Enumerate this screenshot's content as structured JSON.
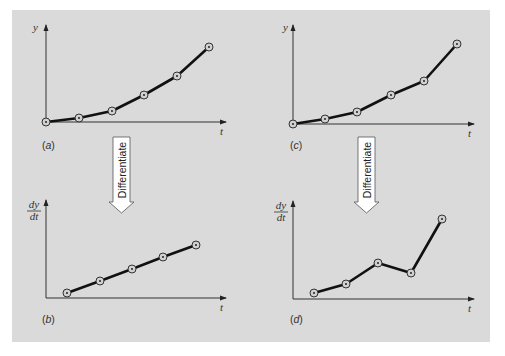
{
  "figure": {
    "background": "#dadada",
    "line_color": "#111111",
    "arrow_text": "Differentiate"
  },
  "chart_data": [
    {
      "type": "line",
      "panel": "a",
      "label_prefix": "(",
      "label_letter": "a",
      "label_suffix": ")",
      "ylabel": "y",
      "xlabel": "t",
      "x": [
        0,
        1,
        2,
        3,
        4,
        5
      ],
      "values": [
        0,
        0.1,
        0.25,
        0.6,
        1.0,
        1.6
      ],
      "px": [
        [
          46,
          122
        ],
        [
          79,
          118
        ],
        [
          112,
          111
        ],
        [
          144,
          95
        ],
        [
          177,
          76
        ],
        [
          209,
          47
        ]
      ]
    },
    {
      "type": "line",
      "panel": "b",
      "label_prefix": "(",
      "label_letter": "b",
      "label_suffix": ")",
      "ylabel_num": "dy",
      "ylabel_den": "dt",
      "xlabel": "t",
      "x": [
        0.5,
        1.5,
        2.5,
        3.5,
        4.5
      ],
      "values": [
        0.1,
        0.25,
        0.4,
        0.55,
        0.7
      ],
      "px": [
        [
          67,
          293
        ],
        [
          100,
          281
        ],
        [
          132,
          269
        ],
        [
          163,
          257
        ],
        [
          196,
          245
        ]
      ]
    },
    {
      "type": "line",
      "panel": "c",
      "label_prefix": "(",
      "label_letter": "c",
      "label_suffix": ")",
      "ylabel": "y",
      "xlabel": "t",
      "x": [
        0,
        1,
        2,
        3,
        4,
        5
      ],
      "values": [
        0,
        0.1,
        0.25,
        0.6,
        0.9,
        1.7
      ],
      "px": [
        [
          293,
          124
        ],
        [
          325,
          119
        ],
        [
          357,
          112
        ],
        [
          391,
          95
        ],
        [
          424,
          81
        ],
        [
          457,
          44
        ]
      ]
    },
    {
      "type": "line",
      "panel": "d",
      "label_prefix": "(",
      "label_letter": "d",
      "label_suffix": ")",
      "ylabel_num": "dy",
      "ylabel_den": "dt",
      "xlabel": "t",
      "x": [
        0.5,
        1.5,
        2.5,
        3.5,
        4.5
      ],
      "values": [
        0.1,
        0.2,
        0.45,
        0.35,
        1.0
      ],
      "px": [
        [
          314,
          293
        ],
        [
          346,
          284
        ],
        [
          378,
          263
        ],
        [
          411,
          273
        ],
        [
          442,
          219
        ]
      ]
    }
  ]
}
